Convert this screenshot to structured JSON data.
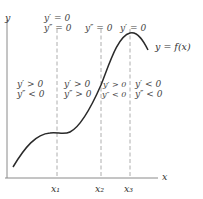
{
  "diagram": {
    "axes": {
      "x_label": "x",
      "y_label": "y"
    },
    "curve_label": "y = f(x)",
    "x_ticks": [
      {
        "label": "x₁",
        "x": 57
      },
      {
        "label": "x₂",
        "x": 101
      },
      {
        "label": "x₃",
        "x": 130
      }
    ],
    "top_annotations": {
      "x1": [
        "y′ = 0",
        "y″ = 0"
      ],
      "x2": [
        "y″ = 0"
      ],
      "x3": [
        "y′ = 0"
      ]
    },
    "regions": [
      {
        "lines": [
          "y′ > 0",
          "y″ < 0"
        ]
      },
      {
        "lines": [
          "y′ > 0",
          "y″ > 0"
        ]
      },
      {
        "lines": [
          "y′ > 0",
          "y″ < 0"
        ]
      },
      {
        "lines": [
          "y′ < 0",
          "y″ < 0"
        ]
      }
    ],
    "colors": {
      "curve": "#2a2a2a",
      "axis": "#888888",
      "dashed": "#999999",
      "text": "#333333"
    }
  }
}
